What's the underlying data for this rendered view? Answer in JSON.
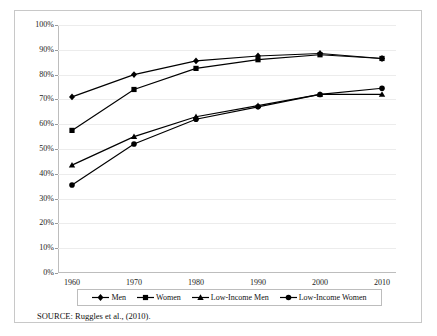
{
  "figure": {
    "source_note": "SOURCE:  Ruggles et al., (2010)."
  },
  "legend": {
    "position": "bottom",
    "entries": [
      {
        "label": "Men",
        "marker": "diamond-marker",
        "color": "#000000"
      },
      {
        "label": "Women",
        "marker": "square-marker",
        "color": "#000000"
      },
      {
        "label": "Low-Income Men",
        "marker": "triangle-marker",
        "color": "#000000"
      },
      {
        "label": "Low-Income Women",
        "marker": "circle-marker",
        "color": "#000000"
      }
    ]
  },
  "chart_data": {
    "type": "line",
    "title": "",
    "subtitle": "",
    "xlabel": "",
    "ylabel": "",
    "x": [
      1960,
      1970,
      1980,
      1990,
      2000,
      2010
    ],
    "categories": [
      "1960",
      "1970",
      "1980",
      "1990",
      "2000",
      "2010"
    ],
    "xtick_labels": [
      "1960",
      "1970",
      "1980",
      "1990",
      "2000",
      "2010"
    ],
    "ytick_labels": [
      "0%",
      "10%",
      "20%",
      "30%",
      "40%",
      "50%",
      "60%",
      "70%",
      "80%",
      "90%",
      "100%"
    ],
    "ytick_values": [
      0,
      10,
      20,
      30,
      40,
      50,
      60,
      70,
      80,
      90,
      100
    ],
    "ylim": [
      0,
      100
    ],
    "xlim": [
      1960,
      2010
    ],
    "grid": true,
    "grid_axis": "y",
    "legend_position": "bottom",
    "series": [
      {
        "name": "Men",
        "marker": "diamond-marker",
        "color": "#000000",
        "values": [
          71,
          80,
          85.5,
          87.5,
          88.5,
          86.5
        ]
      },
      {
        "name": "Women",
        "marker": "square-marker",
        "color": "#000000",
        "values": [
          57.5,
          74,
          82.5,
          86,
          88,
          86.5
        ]
      },
      {
        "name": "Low-Income Men",
        "marker": "triangle-marker",
        "color": "#000000",
        "values": [
          43.5,
          55,
          63,
          67.5,
          72,
          72
        ]
      },
      {
        "name": "Low-Income Women",
        "marker": "circle-marker",
        "color": "#000000",
        "values": [
          35.5,
          52,
          62,
          67,
          72,
          74.5
        ]
      }
    ]
  }
}
